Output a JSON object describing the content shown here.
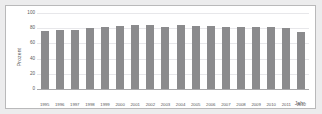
{
  "chart_data": {
    "type": "bar",
    "title": "",
    "subtitle": "",
    "xlabel": "Jahr",
    "ylabel": "Prozent",
    "ylim": [
      0,
      100
    ],
    "yticks": [
      0,
      20,
      40,
      60,
      80,
      100
    ],
    "grid": true,
    "legend": null,
    "bar_color": "#8b8b8d",
    "categories": [
      "1995",
      "1996",
      "1997",
      "1998",
      "1999",
      "2000",
      "2001",
      "2002",
      "2003",
      "2004",
      "2005",
      "2006",
      "2007",
      "2008",
      "2009",
      "2010",
      "2011",
      "2012"
    ],
    "values": [
      76,
      78,
      77,
      80,
      82,
      83,
      84,
      84,
      82,
      84,
      83,
      83,
      82,
      81,
      81,
      82,
      80,
      75
    ],
    "annotations": []
  },
  "figure": {
    "background_color": "#ececed",
    "plot_background_color": "#ffffff",
    "border_color": "#b9b9ba",
    "gridline_color": "#e7e7ea",
    "axis_color": "#a9a9ab"
  }
}
